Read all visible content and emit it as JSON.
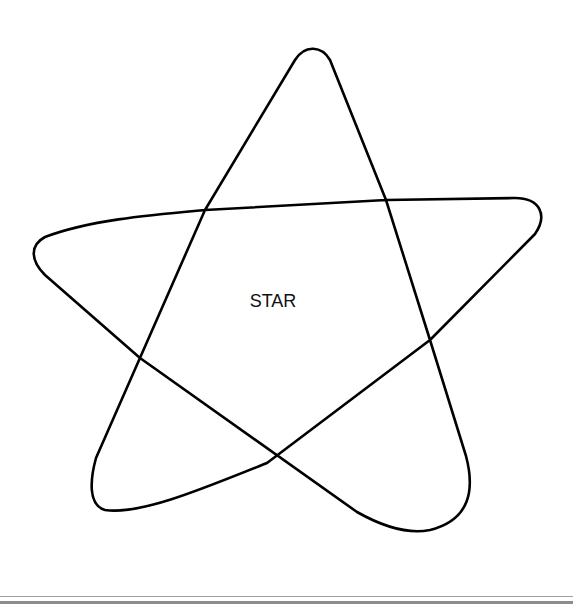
{
  "diagram": {
    "label": "STAR",
    "stroke_color": "#000000",
    "background": "#ffffff"
  },
  "footer": {
    "rule_color_1": "#9a9a9a",
    "rule_color_2": "#8a8a8a"
  }
}
